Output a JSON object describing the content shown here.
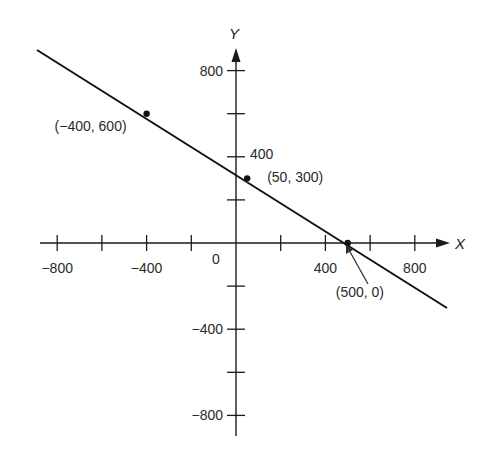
{
  "chart_data": {
    "type": "line",
    "title": "",
    "xlabel": "X",
    "ylabel": "Y",
    "xlim": [
      -900,
      950
    ],
    "ylim": [
      -900,
      900
    ],
    "grid": false,
    "x_ticks": [
      -800,
      -600,
      -400,
      -200,
      0,
      200,
      400,
      600,
      800
    ],
    "y_ticks": [
      -800,
      -600,
      -400,
      -200,
      200,
      400,
      600,
      800
    ],
    "x_tick_labels": [
      {
        "value": -800,
        "label": "−800"
      },
      {
        "value": -400,
        "label": "−400"
      },
      {
        "value": 0,
        "label": "0"
      },
      {
        "value": 400,
        "label": "400"
      },
      {
        "value": 800,
        "label": "800"
      }
    ],
    "y_tick_labels": [
      {
        "value": 800,
        "label": "800"
      },
      {
        "value": 400,
        "label": "400"
      },
      {
        "value": -400,
        "label": "−400"
      },
      {
        "value": -800,
        "label": "−800"
      }
    ],
    "series": [
      {
        "name": "line",
        "x": [
          -900,
          -400,
          50,
          500,
          950
        ],
        "y": [
          900,
          600,
          300,
          0,
          -300
        ]
      }
    ],
    "points": [
      {
        "x": -400,
        "y": 600,
        "label": "(−400, 600)"
      },
      {
        "x": 50,
        "y": 300,
        "label": "(50, 300)"
      },
      {
        "x": 500,
        "y": 0,
        "label": "(500, 0)"
      }
    ],
    "annotations": [
      {
        "text": "(500, 0)",
        "type": "arrow",
        "target": {
          "x": 500,
          "y": 0
        }
      }
    ]
  }
}
